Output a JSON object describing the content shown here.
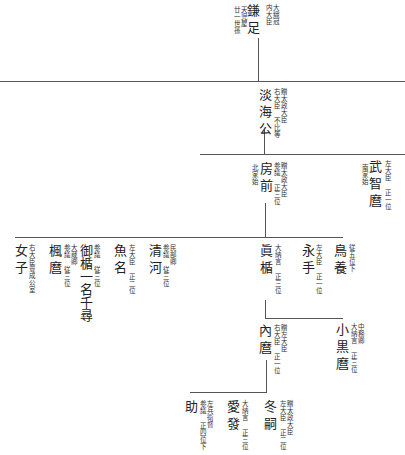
{
  "chart_title": "",
  "nodes": {
    "kamatari": {
      "name": "鎌足",
      "note_right": "大織冠\n内大臣",
      "note_left": "天児屋\n廿一世孫"
    },
    "tankai": {
      "name": "淡海公",
      "note_right": "贈太政大臣\n右大臣 不比等"
    },
    "fusasaki": {
      "name": "房前",
      "note_right": "贈太政大臣\n参議 正三位",
      "note_left": "北家始"
    },
    "muchimaro": {
      "name": "武智麿",
      "note_right": "左大臣 正一位",
      "note_left": "南家始"
    },
    "torikai": {
      "name": "鳥養",
      "note_right": "従五位下"
    },
    "nagate": {
      "name": "永手",
      "note_right": "左大臣 正一位"
    },
    "matate": {
      "name": "眞楯",
      "note_right": "大納言 正三位"
    },
    "kiyokawa": {
      "name": "清河",
      "note_right": "民部卿\n参議 従三位"
    },
    "uona": {
      "name": "魚名",
      "note_right": "左大臣 正二位"
    },
    "mitate": {
      "name": "御楯一名千尋",
      "note_right": "参議 従三位"
    },
    "kaede": {
      "name": "楓麿",
      "note_right": "大蔵卿\n参議 従三位"
    },
    "joshi": {
      "name": "女子",
      "note_right": "右大臣豊成公室"
    },
    "uchimaro": {
      "name": "內麿",
      "note_right": "贈左大臣\n右大臣 正一位"
    },
    "oguromaro": {
      "name": "小黒麿",
      "note_right": "中務卿\n大納言 正三位"
    },
    "fuyutsugu": {
      "name": "冬嗣",
      "note_right": "贈太政大臣\n左大臣 正二位"
    },
    "manatsu": {
      "name": "愛發",
      "note_right": "大納言 正三位"
    },
    "suke": {
      "name": "助",
      "note_right": "左兵衛督\n参議 正四位下"
    }
  }
}
